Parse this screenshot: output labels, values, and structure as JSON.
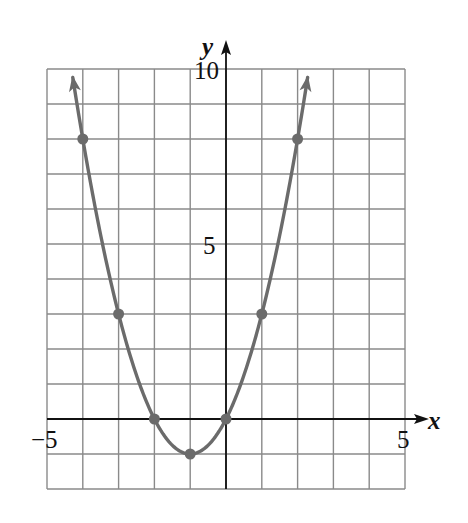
{
  "chart_data": {
    "type": "line",
    "title": "",
    "function": "y = x^2 + 2x",
    "xlabel": "x",
    "ylabel": "y",
    "xlim": [
      -5,
      5
    ],
    "ylim": [
      -2,
      10
    ],
    "grid": true,
    "grid_step": 1,
    "x_tick_labels": [
      {
        "value": -5,
        "label": "−5"
      },
      {
        "value": 5,
        "label": "5"
      }
    ],
    "y_tick_labels": [
      {
        "value": 10,
        "label": "10"
      },
      {
        "value": 5,
        "label": "5"
      }
    ],
    "points": [
      {
        "x": -4,
        "y": 8
      },
      {
        "x": -3,
        "y": 3
      },
      {
        "x": -2,
        "y": 0
      },
      {
        "x": -1,
        "y": -1
      },
      {
        "x": 0,
        "y": 0
      },
      {
        "x": 1,
        "y": 3
      },
      {
        "x": 2,
        "y": 8
      }
    ],
    "vertex": {
      "x": -1,
      "y": -1
    },
    "curve_extends_with_arrows": true,
    "curve_color": "#6b6b6b",
    "grid_color": "#8a8a8a",
    "axis_color": "#111111"
  },
  "labels": {
    "x_axis": "x",
    "y_axis": "y",
    "x_min": "−5",
    "x_max": "5",
    "y_max": "10",
    "y_mid": "5"
  }
}
